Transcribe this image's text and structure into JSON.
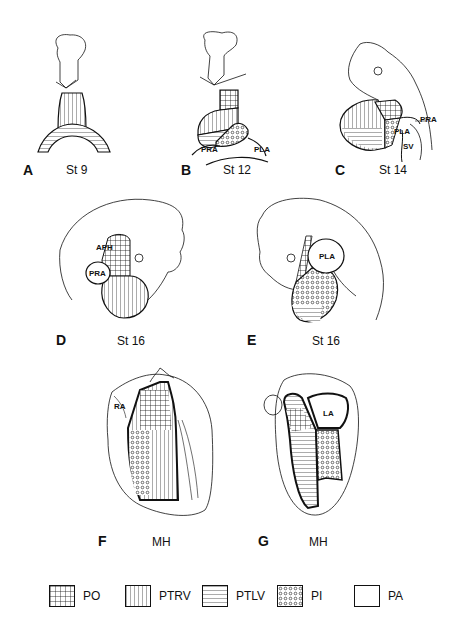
{
  "figure": {
    "panels": [
      {
        "id": "A",
        "stage": "St 9"
      },
      {
        "id": "B",
        "stage": "St 12",
        "annotations": [
          "PRA",
          "PLA"
        ]
      },
      {
        "id": "C",
        "stage": "St 14",
        "annotations": [
          "PRA",
          "PLA",
          "SV"
        ]
      },
      {
        "id": "D",
        "stage": "St 16",
        "annotations": [
          "APH",
          "PRA"
        ]
      },
      {
        "id": "E",
        "stage": "St 16",
        "annotations": [
          "PLA"
        ]
      },
      {
        "id": "F",
        "stage": "MH",
        "annotations": [
          "RA"
        ]
      },
      {
        "id": "G",
        "stage": "MH",
        "annotations": [
          "LA"
        ]
      }
    ],
    "legend": [
      {
        "label": "PO",
        "pattern": "grid"
      },
      {
        "label": "PTRV",
        "pattern": "vertical-lines"
      },
      {
        "label": "PTLV",
        "pattern": "horizontal-lines"
      },
      {
        "label": "PI",
        "pattern": "circles"
      },
      {
        "label": "PA",
        "pattern": "blank"
      }
    ]
  }
}
